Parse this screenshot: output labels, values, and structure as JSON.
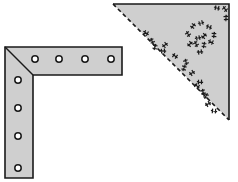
{
  "diagram": {
    "title": "",
    "colors": {
      "background": "#ffffff",
      "fill": "#cfcfcf",
      "stroke": "#1a1a1a"
    },
    "l_bracket": {
      "label": "",
      "outer_corner": [
        5,
        47
      ],
      "inner_corner": [
        33,
        75
      ],
      "horizontal_arm_end_x": 122,
      "vertical_arm_end_y": 178,
      "holes_horizontal": [
        [
          35,
          59
        ],
        [
          59,
          59
        ],
        [
          85,
          59
        ],
        [
          111,
          59
        ]
      ],
      "holes_vertical": [
        [
          18,
          80
        ],
        [
          18,
          108
        ],
        [
          18,
          136
        ],
        [
          18,
          168
        ]
      ],
      "hole_radius": 3.2
    },
    "triangle_gusset": {
      "label": "",
      "vertices": [
        [
          113,
          4
        ],
        [
          229,
          4
        ],
        [
          229,
          120
        ]
      ],
      "hypotenuse_style": "dashed",
      "marks": [
        [
          217,
          8
        ],
        [
          225,
          9
        ],
        [
          226,
          18
        ],
        [
          193,
          26
        ],
        [
          201,
          23
        ],
        [
          209,
          27
        ],
        [
          188,
          34
        ],
        [
          214,
          35
        ],
        [
          204,
          36
        ],
        [
          198,
          38
        ],
        [
          211,
          42
        ],
        [
          196,
          44
        ],
        [
          204,
          45
        ],
        [
          190,
          44
        ],
        [
          200,
          52
        ],
        [
          146,
          33
        ],
        [
          152,
          41
        ],
        [
          155,
          47
        ],
        [
          165,
          45
        ],
        [
          163,
          51
        ],
        [
          175,
          56
        ],
        [
          186,
          62
        ],
        [
          184,
          68
        ],
        [
          192,
          73
        ],
        [
          200,
          82
        ],
        [
          197,
          86
        ],
        [
          203,
          92
        ],
        [
          206,
          96
        ],
        [
          208,
          104
        ],
        [
          214,
          111
        ]
      ]
    }
  }
}
